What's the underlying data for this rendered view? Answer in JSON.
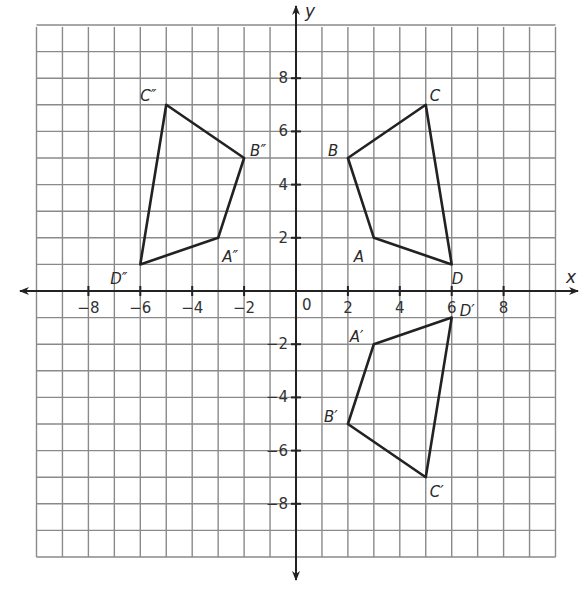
{
  "diagram": {
    "type": "coordinate-plane-transformations",
    "axes": {
      "x_label": "x",
      "y_label": "y",
      "origin_label": "0",
      "x_range": [
        -10,
        10
      ],
      "y_range": [
        -10,
        10
      ],
      "x_ticks": [
        -8,
        -6,
        -4,
        -2,
        2,
        4,
        6,
        8
      ],
      "y_ticks": [
        -8,
        -6,
        -4,
        -2,
        2,
        4,
        6,
        8
      ],
      "grid": true
    },
    "colors": {
      "grid": "#8a8a8a",
      "axis": "#222222",
      "shape": "#222222",
      "background": "#ffffff"
    },
    "figures": [
      {
        "name": "ABCD",
        "vertices": [
          {
            "label": "A",
            "x": 3,
            "y": 2,
            "label_dx": -20,
            "label_dy": 24
          },
          {
            "label": "B",
            "x": 2,
            "y": 5,
            "label_dx": -20,
            "label_dy": -2
          },
          {
            "label": "C",
            "x": 5,
            "y": 7,
            "label_dx": 4,
            "label_dy": -4
          },
          {
            "label": "D",
            "x": 6,
            "y": 1,
            "label_dx": 0,
            "label_dy": 20
          }
        ]
      },
      {
        "name": "A'B'C'D'",
        "vertices": [
          {
            "label": "A′",
            "x": 3,
            "y": -2,
            "label_dx": -24,
            "label_dy": -2
          },
          {
            "label": "B′",
            "x": 2,
            "y": -5,
            "label_dx": -24,
            "label_dy": -2
          },
          {
            "label": "C′",
            "x": 5,
            "y": -7,
            "label_dx": 4,
            "label_dy": 20
          },
          {
            "label": "D′",
            "x": 6,
            "y": -1,
            "label_dx": 8,
            "label_dy": -2
          }
        ]
      },
      {
        "name": "A''B''C''D''",
        "vertices": [
          {
            "label": "A″",
            "x": -3,
            "y": 2,
            "label_dx": 4,
            "label_dy": 24
          },
          {
            "label": "B″",
            "x": -2,
            "y": 5,
            "label_dx": 6,
            "label_dy": -2
          },
          {
            "label": "C″",
            "x": -5,
            "y": 7,
            "label_dx": -26,
            "label_dy": -4
          },
          {
            "label": "D″",
            "x": -6,
            "y": 1,
            "label_dx": -30,
            "label_dy": 20
          }
        ]
      }
    ]
  }
}
